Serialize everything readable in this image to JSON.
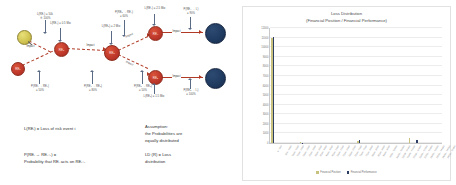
{
  "diagram": {
    "nodes": [
      {
        "id": "source",
        "label": "",
        "type": "olive",
        "x": 17,
        "y": 30,
        "d": 13
      },
      {
        "id": "re1",
        "label": "RE₁",
        "type": "red",
        "x": 11,
        "y": 62,
        "d": 12
      },
      {
        "id": "re2",
        "label": "RE₂",
        "type": "red",
        "x": 54,
        "y": 42,
        "d": 13
      },
      {
        "id": "re3",
        "label": "RE₃",
        "type": "red",
        "x": 104,
        "y": 45,
        "d": 14
      },
      {
        "id": "re4",
        "label": "RE₄",
        "type": "red",
        "x": 148,
        "y": 26,
        "d": 13
      },
      {
        "id": "re5",
        "label": "RE₅",
        "type": "red",
        "x": 148,
        "y": 70,
        "d": 13
      },
      {
        "id": "imp1",
        "label": "",
        "type": "navy",
        "x": 205,
        "y": 23,
        "d": 19
      },
      {
        "id": "imp2",
        "label": "",
        "type": "navy",
        "x": 205,
        "y": 68,
        "d": 19
      }
    ],
    "edge_tags": [
      {
        "text": "Impact",
        "x": 39,
        "y": 47
      },
      {
        "text": "Impact",
        "x": 82,
        "y": 48
      },
      {
        "text": "Impact",
        "x": 129,
        "y": 36
      },
      {
        "text": "Impact",
        "x": 129,
        "y": 63
      },
      {
        "text": "Impact",
        "x": 177,
        "y": 33
      },
      {
        "text": "Impact",
        "x": 177,
        "y": 76
      }
    ],
    "annotations": [
      {
        "text": "L(RE₁) = 50k\n≙ 100%",
        "x": 36,
        "y": 14
      },
      {
        "text": "P(RE₁ → RE₂)\n= 50%",
        "x": 28,
        "y": 88
      },
      {
        "text": "L(RE₂) = 0.5 Mio",
        "x": 46,
        "y": 21
      },
      {
        "text": "P(RE₂ → RE₃)\n= 80%",
        "x": 81,
        "y": 88
      },
      {
        "text": "L(RE₃) = 2 Mio",
        "x": 95,
        "y": 24
      },
      {
        "text": "P(RE₃ → RE₄)\n= 60%",
        "x": 109,
        "y": 12
      },
      {
        "text": "L(RE₄) = 2.5 Mio",
        "x": 143,
        "y": 8
      },
      {
        "text": "P(RE₃ → RE₅)\n= 50%",
        "x": 131,
        "y": 86
      },
      {
        "text": "L(RE₅) = 1.5 Mio",
        "x": 140,
        "y": 97
      },
      {
        "text": "P(RE₄ → I₁)\n= 90%",
        "x": 184,
        "y": 10
      },
      {
        "text": "P(RE₅ → I₂)\n= 100%",
        "x": 184,
        "y": 88
      }
    ],
    "legend_left": "L(REᵢ) = Loss of risk event i",
    "legend_left2": "P(REᵢ → REᵢ₊₁) =\nProbability that REᵢ acts on REᵢ₊₁",
    "legend_right": "Assumption:\nthe Probabilities are\nequally distributed",
    "legend_right2": "LD (R) = Loss\ndistribution"
  },
  "chart_data": {
    "type": "bar",
    "title": "Loss Distribution\n(Financial Position / Financial Performance)",
    "xlabel": "",
    "ylabel": "",
    "ylim": [
      0,
      12000
    ],
    "grid": true,
    "legend_position": "bottom",
    "yticks": [
      0,
      1000,
      2000,
      3000,
      4000,
      5000,
      6000,
      7000,
      8000,
      9000,
      10000,
      11000,
      12000
    ],
    "ytick_labels": [
      "0",
      "1000",
      "2000",
      "3000",
      "4000",
      "5000",
      "6000",
      "7000",
      "8000",
      "9000",
      "10000",
      "11000",
      "12000"
    ],
    "categories": [
      "0 - 500",
      "500 - 1000",
      "1000 - 1500",
      "1500 - 2000",
      "2000 - 2500",
      "2500 - 3000",
      "3000 - 3500",
      "3500 - 4000",
      "4000 - 4500",
      "4500 - 5000",
      "5000 - 5500",
      "5500 - 6000",
      "6000 - 6500",
      "6500 - 7000",
      "7000 - 7500",
      "7500 - 8000",
      "8000 - 8500",
      "8500 - 9000",
      "9000 - 9500",
      "9500 - 10000",
      "10000 - 10500",
      "10500 - 11000",
      "11000 - 11500",
      "11500 - 12000",
      "12000 - 12500",
      "12500 - 13000",
      "13000 - 13500",
      "13500 - 14000",
      "14000 - 14500",
      "14500 - 15000"
    ],
    "series": [
      {
        "name": "Financial Position",
        "color": "#c8c27e",
        "values": [
          11000,
          0,
          0,
          0,
          0,
          60,
          0,
          0,
          0,
          0,
          0,
          0,
          0,
          0,
          0,
          260,
          0,
          0,
          0,
          0,
          0,
          0,
          0,
          0,
          480,
          0,
          0,
          0,
          0,
          0
        ]
      },
      {
        "name": "Financial Performance",
        "color": "#2c3e63",
        "values": [
          11050,
          0,
          0,
          0,
          0,
          40,
          0,
          0,
          0,
          0,
          0,
          0,
          0,
          0,
          0,
          320,
          0,
          0,
          0,
          0,
          0,
          0,
          0,
          0,
          0,
          330,
          0,
          0,
          0,
          0
        ]
      }
    ]
  }
}
